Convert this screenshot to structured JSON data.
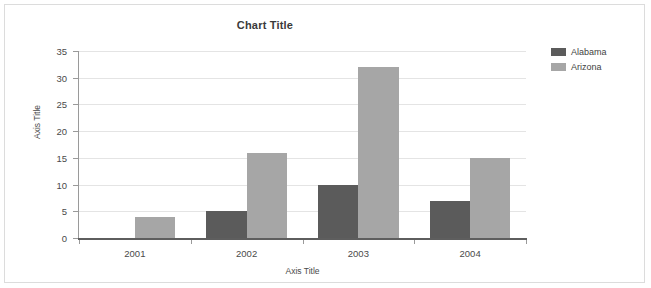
{
  "chart_data": {
    "type": "bar",
    "title": "Chart Title",
    "xlabel": "Axis Title",
    "ylabel": "Axis Title",
    "categories": [
      "2001",
      "2002",
      "2003",
      "2004"
    ],
    "series": [
      {
        "name": "Alabama",
        "color": "#5b5b5b",
        "values": [
          0,
          5,
          10,
          7
        ]
      },
      {
        "name": "Arizona",
        "color": "#a6a6a6",
        "values": [
          4,
          16,
          32,
          15
        ]
      }
    ],
    "ylim": [
      0,
      35
    ],
    "yticks": [
      0,
      5,
      10,
      15,
      20,
      25,
      30,
      35
    ],
    "ytick_labels": [
      "0",
      "5",
      "10",
      "15",
      "20",
      "25",
      "30",
      "35"
    ],
    "grid": true,
    "grid_axis": "y",
    "legend_position": "right",
    "legend_entries": [
      "Alabama",
      "Arizona"
    ]
  },
  "frame": {
    "border_color": "#dcdcdc",
    "background": "#ffffff"
  }
}
